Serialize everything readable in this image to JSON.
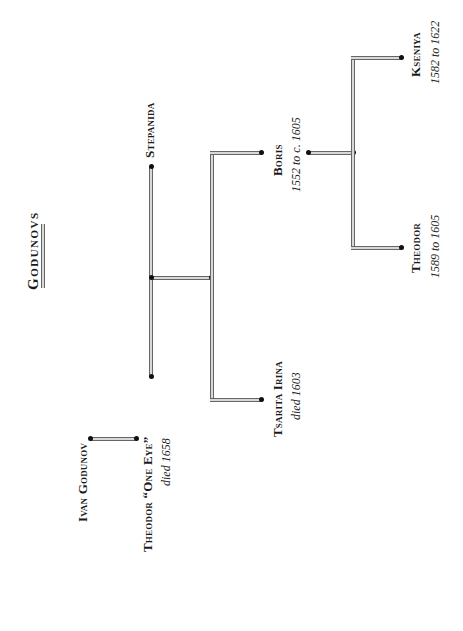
{
  "title": "Godunovs",
  "people": {
    "ivan": {
      "name": "Ivan Godunov"
    },
    "theodor_one_eye": {
      "name": "Theodor “One Eye”",
      "dates": "died 1658"
    },
    "stepanida": {
      "name": "Stepanida"
    },
    "boris": {
      "name": "Boris",
      "dates": "1552 to c. 1605"
    },
    "irina": {
      "name": "Tsarita Irina",
      "dates": "died 1603"
    },
    "kseniya": {
      "name": "Kseniya",
      "dates": "1582 to 1622"
    },
    "theodor_son": {
      "name": "Theodor",
      "dates": "1589  to 1605"
    }
  },
  "colors": {
    "line_fill": "#d8d8d8",
    "line_edge": "#666666",
    "text": "#1a1a1a"
  }
}
